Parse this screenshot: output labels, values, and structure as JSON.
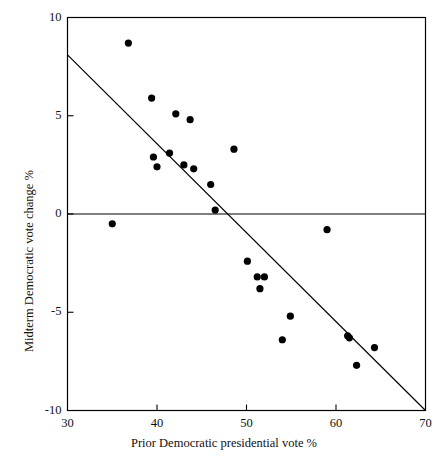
{
  "chart_data": {
    "type": "scatter",
    "title": "",
    "xlabel": "Prior Democratic presidential vote %",
    "ylabel": "Midterm Democratic vote change %",
    "xlim": [
      30,
      70
    ],
    "ylim": [
      -10,
      10
    ],
    "xticks": [
      30,
      40,
      50,
      60,
      70
    ],
    "yticks": [
      -10,
      -5,
      0,
      5,
      10
    ],
    "xtick_labels": [
      "30",
      "40",
      "50",
      "60",
      "70"
    ],
    "ytick_labels": [
      "-10",
      "-5",
      "0",
      "5",
      "10"
    ],
    "grid": false,
    "legend": null,
    "marker": "filled-circle",
    "marker_color": "#000000",
    "frame_color": "#000000",
    "points": [
      {
        "x": 35.0,
        "y": -0.5
      },
      {
        "x": 36.8,
        "y": 8.7
      },
      {
        "x": 39.4,
        "y": 5.9
      },
      {
        "x": 39.6,
        "y": 2.9
      },
      {
        "x": 40.0,
        "y": 2.4
      },
      {
        "x": 41.4,
        "y": 3.1
      },
      {
        "x": 42.1,
        "y": 5.1
      },
      {
        "x": 43.0,
        "y": 2.5
      },
      {
        "x": 43.7,
        "y": 4.8
      },
      {
        "x": 44.1,
        "y": 2.3
      },
      {
        "x": 46.0,
        "y": 1.5
      },
      {
        "x": 46.5,
        "y": 0.2
      },
      {
        "x": 48.6,
        "y": 3.3
      },
      {
        "x": 50.1,
        "y": -2.4
      },
      {
        "x": 51.2,
        "y": -3.2
      },
      {
        "x": 51.5,
        "y": -3.8
      },
      {
        "x": 52.0,
        "y": -3.2
      },
      {
        "x": 54.0,
        "y": -6.4
      },
      {
        "x": 54.9,
        "y": -5.2
      },
      {
        "x": 59.0,
        "y": -0.8
      },
      {
        "x": 61.3,
        "y": -6.2
      },
      {
        "x": 61.5,
        "y": -6.3
      },
      {
        "x": 62.3,
        "y": -7.7
      },
      {
        "x": 64.3,
        "y": -6.8
      }
    ],
    "fit_line": {
      "x_start": 30,
      "y_start": 8.1,
      "x_end": 70,
      "y_end": -10.0
    },
    "reference_line": {
      "orientation": "horizontal",
      "y": 0
    }
  }
}
